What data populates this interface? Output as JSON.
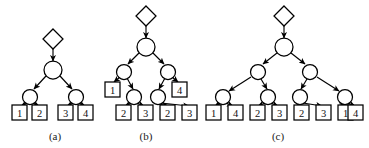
{
  "figure": {
    "background_color": "#ffffff",
    "stroke_color": "#000000",
    "node_fill_color": "#ffffff",
    "text_color": "#111111",
    "width": 369,
    "height": 148
  },
  "panels": [
    {
      "id": "a",
      "caption": "(a)",
      "caption_x": 55,
      "caption_y": 136,
      "root": {
        "shape": "diamond",
        "cx": 53,
        "cy": 39,
        "r": 10
      },
      "circles": [
        {
          "name": "a-c0",
          "cx": 53,
          "cy": 70,
          "r": 9
        },
        {
          "name": "a-c1",
          "cx": 30,
          "cy": 97,
          "r": 7.5
        },
        {
          "name": "a-c2",
          "cx": 76,
          "cy": 97,
          "r": 7.5
        }
      ],
      "leaves": [
        {
          "name": "a-leaf-1",
          "label": "1",
          "x": 12,
          "y": 105,
          "w": 15,
          "h": 15
        },
        {
          "name": "a-leaf-2",
          "label": "2",
          "x": 32,
          "y": 105,
          "w": 15,
          "h": 15
        },
        {
          "name": "a-leaf-3",
          "label": "3",
          "x": 58,
          "y": 105,
          "w": 15,
          "h": 15
        },
        {
          "name": "a-leaf-4",
          "label": "4",
          "x": 78,
          "y": 105,
          "w": 15,
          "h": 15
        }
      ],
      "leaf_labels": [
        "1",
        "2",
        "3",
        "4"
      ],
      "edges": [
        {
          "from": "diamond",
          "to": "a-c0",
          "x1": 53,
          "y1": 49,
          "x2": 53,
          "y2": 61
        },
        {
          "from": "a-c0",
          "to": "a-c1",
          "x1": 46,
          "y1": 76,
          "x2": 34,
          "y2": 89
        },
        {
          "from": "a-c0",
          "to": "a-c2",
          "x1": 60,
          "y1": 76,
          "x2": 72,
          "y2": 89
        },
        {
          "from": "a-c1",
          "to": "a-leaf-1",
          "x1": 27,
          "y1": 103,
          "x2": 21,
          "y2": 106
        },
        {
          "from": "a-c1",
          "to": "a-leaf-2",
          "x1": 33,
          "y1": 103,
          "x2": 39,
          "y2": 106
        },
        {
          "from": "a-c2",
          "to": "a-leaf-3",
          "x1": 73,
          "y1": 103,
          "x2": 67,
          "y2": 106
        },
        {
          "from": "a-c2",
          "to": "a-leaf-4",
          "x1": 79,
          "y1": 103,
          "x2": 85,
          "y2": 106
        }
      ]
    },
    {
      "id": "b",
      "caption": "(b)",
      "caption_x": 146,
      "caption_y": 136,
      "root": {
        "shape": "diamond",
        "cx": 146,
        "cy": 16,
        "r": 10
      },
      "circles": [
        {
          "name": "b-c0",
          "cx": 146,
          "cy": 47,
          "r": 9
        },
        {
          "name": "b-c1",
          "cx": 124,
          "cy": 72,
          "r": 7.5
        },
        {
          "name": "b-c2",
          "cx": 168,
          "cy": 72,
          "r": 7.5
        },
        {
          "name": "b-c3",
          "cx": 134,
          "cy": 97,
          "r": 7.5
        },
        {
          "name": "b-c4",
          "cx": 158,
          "cy": 97,
          "r": 7.5
        }
      ],
      "leaves": [
        {
          "name": "b-leaf-1",
          "label": "1",
          "x": 105,
          "y": 82,
          "w": 15,
          "h": 15
        },
        {
          "name": "b-leaf-4",
          "label": "4",
          "x": 172,
          "y": 82,
          "w": 15,
          "h": 15
        },
        {
          "name": "b-leaf-2a",
          "label": "2",
          "x": 116,
          "y": 105,
          "w": 15,
          "h": 15
        },
        {
          "name": "b-leaf-3a",
          "label": "3",
          "x": 138,
          "y": 105,
          "w": 15,
          "h": 15
        },
        {
          "name": "b-leaf-2b",
          "label": "2",
          "x": 160,
          "y": 105,
          "w": 15,
          "h": 15
        },
        {
          "name": "b-leaf-3b",
          "label": "3",
          "x": 182,
          "y": 105,
          "w": 15,
          "h": 15
        }
      ],
      "leaf_labels": [
        "1",
        "4",
        "2",
        "3",
        "2",
        "3"
      ],
      "edges": [
        {
          "from": "diamond",
          "to": "b-c0",
          "x1": 146,
          "y1": 26,
          "x2": 146,
          "y2": 38
        },
        {
          "from": "b-c0",
          "to": "b-c1",
          "x1": 139,
          "y1": 53,
          "x2": 128,
          "y2": 64
        },
        {
          "from": "b-c0",
          "to": "b-c2",
          "x1": 153,
          "y1": 53,
          "x2": 164,
          "y2": 64
        },
        {
          "from": "b-c1",
          "to": "b-leaf-1",
          "x1": 120,
          "y1": 77,
          "x2": 114,
          "y2": 82
        },
        {
          "from": "b-c1",
          "to": "b-c3",
          "x1": 127,
          "y1": 78,
          "x2": 133,
          "y2": 89
        },
        {
          "from": "b-c2",
          "to": "b-leaf-4",
          "x1": 172,
          "y1": 77,
          "x2": 178,
          "y2": 82
        },
        {
          "from": "b-c2",
          "to": "b-c4",
          "x1": 165,
          "y1": 78,
          "x2": 159,
          "y2": 89
        },
        {
          "from": "b-c3",
          "to": "b-leaf-2a",
          "x1": 131,
          "y1": 103,
          "x2": 125,
          "y2": 106
        },
        {
          "from": "b-c3",
          "to": "b-leaf-3a",
          "x1": 137,
          "y1": 103,
          "x2": 144,
          "y2": 106
        },
        {
          "from": "b-c4",
          "to": "b-leaf-2b",
          "x1": 155,
          "y1": 103,
          "x2": 168,
          "y2": 106
        },
        {
          "from": "b-c4",
          "to": "b-leaf-3b",
          "x1": 161,
          "y1": 103,
          "x2": 189,
          "y2": 106
        }
      ]
    },
    {
      "id": "c",
      "caption": "(c)",
      "caption_x": 278,
      "caption_y": 136,
      "root": {
        "shape": "diamond",
        "cx": 284,
        "cy": 16,
        "r": 10
      },
      "circles": [
        {
          "name": "c-c0",
          "cx": 284,
          "cy": 47,
          "r": 9
        },
        {
          "name": "c-c1",
          "cx": 258,
          "cy": 72,
          "r": 7.5
        },
        {
          "name": "c-c2",
          "cx": 310,
          "cy": 72,
          "r": 7.5
        },
        {
          "name": "c-c3",
          "cx": 223,
          "cy": 97,
          "r": 7.5
        },
        {
          "name": "c-c4",
          "cx": 268,
          "cy": 97,
          "r": 7.5
        },
        {
          "name": "c-c5",
          "cx": 300,
          "cy": 97,
          "r": 7.5
        },
        {
          "name": "c-c6",
          "cx": 345,
          "cy": 97,
          "r": 7.5
        }
      ],
      "leaves": [
        {
          "name": "c-leaf-1a",
          "label": "1",
          "x": 206,
          "y": 105,
          "w": 15,
          "h": 15
        },
        {
          "name": "c-leaf-4a",
          "label": "4",
          "x": 228,
          "y": 105,
          "w": 15,
          "h": 15
        },
        {
          "name": "c-leaf-2a",
          "label": "2",
          "x": 250,
          "y": 105,
          "w": 15,
          "h": 15
        },
        {
          "name": "c-leaf-3a",
          "label": "3",
          "x": 272,
          "y": 105,
          "w": 15,
          "h": 15
        },
        {
          "name": "c-leaf-2b",
          "label": "2",
          "x": 294,
          "y": 105,
          "w": 15,
          "h": 15
        },
        {
          "name": "c-leaf-3b",
          "label": "3",
          "x": 316,
          "y": 105,
          "w": 15,
          "h": 15
        },
        {
          "name": "c-leaf-1b",
          "label": "1",
          "x": 338,
          "y": 105,
          "w": 15,
          "h": 15
        },
        {
          "name": "c-leaf-4b",
          "label": "4",
          "x": 348,
          "y": 105,
          "w": 15,
          "h": 15
        }
      ],
      "leaf_labels": [
        "1",
        "4",
        "2",
        "3",
        "2",
        "3",
        "1",
        "4"
      ],
      "edges": [
        {
          "from": "diamond",
          "to": "c-c0",
          "x1": 284,
          "y1": 26,
          "x2": 284,
          "y2": 38
        },
        {
          "from": "c-c0",
          "to": "c-c1",
          "x1": 277,
          "y1": 53,
          "x2": 263,
          "y2": 64
        },
        {
          "from": "c-c0",
          "to": "c-c2",
          "x1": 291,
          "y1": 53,
          "x2": 305,
          "y2": 64
        },
        {
          "from": "c-c1",
          "to": "c-c3",
          "x1": 251,
          "y1": 77,
          "x2": 229,
          "y2": 91
        },
        {
          "from": "c-c1",
          "to": "c-c4",
          "x1": 261,
          "y1": 79,
          "x2": 267,
          "y2": 89
        },
        {
          "from": "c-c2",
          "to": "c-c5",
          "x1": 307,
          "y1": 79,
          "x2": 301,
          "y2": 89
        },
        {
          "from": "c-c2",
          "to": "c-c6",
          "x1": 317,
          "y1": 77,
          "x2": 339,
          "y2": 91
        },
        {
          "from": "c-c3",
          "to": "c-leaf-1a",
          "x1": 220,
          "y1": 103,
          "x2": 215,
          "y2": 106
        },
        {
          "from": "c-c3",
          "to": "c-leaf-4a",
          "x1": 226,
          "y1": 103,
          "x2": 233,
          "y2": 106
        },
        {
          "from": "c-c4",
          "to": "c-leaf-2a",
          "x1": 265,
          "y1": 103,
          "x2": 258,
          "y2": 106
        },
        {
          "from": "c-c4",
          "to": "c-leaf-3a",
          "x1": 271,
          "y1": 103,
          "x2": 278,
          "y2": 106
        },
        {
          "from": "c-c5",
          "to": "c-leaf-2b",
          "x1": 297,
          "y1": 103,
          "x2": 302,
          "y2": 106
        },
        {
          "from": "c-c5",
          "to": "c-leaf-3b",
          "x1": 303,
          "y1": 103,
          "x2": 322,
          "y2": 106
        },
        {
          "from": "c-c6",
          "to": "c-leaf-1b",
          "x1": 342,
          "y1": 103,
          "x2": 345,
          "y2": 106
        },
        {
          "from": "c-c6",
          "to": "c-leaf-4b",
          "x1": 348,
          "y1": 103,
          "x2": 355,
          "y2": 106
        }
      ]
    }
  ]
}
